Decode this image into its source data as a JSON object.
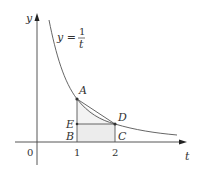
{
  "diagram": {
    "equation": {
      "lhs": "y =",
      "numerator": "1",
      "denominator": "t"
    },
    "axes": {
      "x_label": "t",
      "y_label": "y",
      "origin_label": "0"
    },
    "ticks": [
      "1",
      "2"
    ],
    "points": {
      "A": "A",
      "B": "B",
      "C": "C",
      "D": "D",
      "E": "E"
    },
    "colors": {
      "curve": "#555555",
      "region": "#ececec",
      "axis": "#444444"
    }
  }
}
